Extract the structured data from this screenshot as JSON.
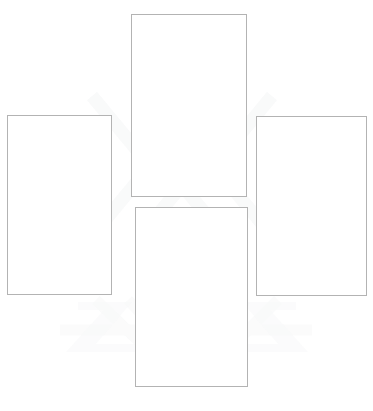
{
  "page": {
    "background_color": "#ffffff",
    "width": 373,
    "height": 411
  },
  "style": {
    "frame_border_color": "#b3b3b3",
    "frame_fill_color": "#ffffff",
    "watermark_color": "#f2f3f4"
  },
  "watermark": {
    "visible": true,
    "description": "very faint light-gray diagonal chevron marks behind the frames",
    "opacity": "0.55"
  },
  "frames": [
    {
      "id": "top",
      "name": "frame-top",
      "position": "top-center",
      "label": "",
      "content": "",
      "x": 131,
      "y": 14,
      "width": 116,
      "height": 183
    },
    {
      "id": "bottom",
      "name": "frame-bottom",
      "position": "bottom-center",
      "label": "",
      "content": "",
      "x": 135,
      "y": 207,
      "width": 113,
      "height": 180
    },
    {
      "id": "left",
      "name": "frame-left",
      "position": "middle-left",
      "label": "",
      "content": "",
      "x": 7,
      "y": 115,
      "width": 105,
      "height": 180
    },
    {
      "id": "right",
      "name": "frame-right",
      "position": "middle-right",
      "label": "",
      "content": "",
      "x": 256,
      "y": 116,
      "width": 111,
      "height": 180
    }
  ]
}
